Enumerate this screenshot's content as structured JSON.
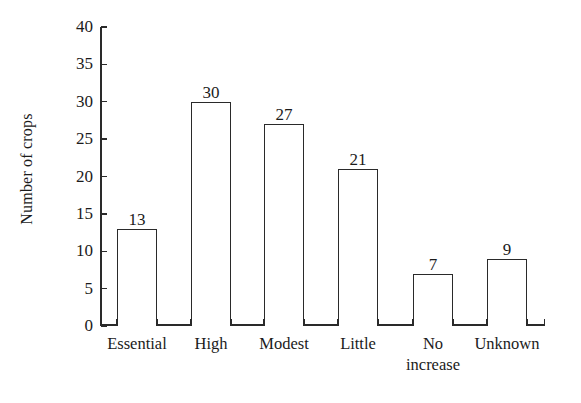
{
  "chart_data": {
    "type": "bar",
    "title": "",
    "xlabel": "",
    "ylabel": "Number of crops",
    "categories": [
      "Essential",
      "High",
      "Modest",
      "Little",
      "No\nincrease",
      "Unknown"
    ],
    "values": [
      13,
      30,
      27,
      21,
      7,
      9
    ],
    "value_labels": [
      "13",
      "30",
      "27",
      "21",
      "7",
      "9"
    ],
    "ylim": [
      0,
      40
    ],
    "yticks": [
      0,
      5,
      10,
      15,
      20,
      25,
      30,
      35,
      40
    ],
    "ytick_labels": [
      "0",
      "5",
      "10",
      "15",
      "20",
      "25",
      "30",
      "35",
      "40"
    ],
    "grid": false,
    "legend": null,
    "bar_fill": "#ffffff",
    "bar_edge": "#2a2a2a",
    "background": "#ffffff"
  }
}
